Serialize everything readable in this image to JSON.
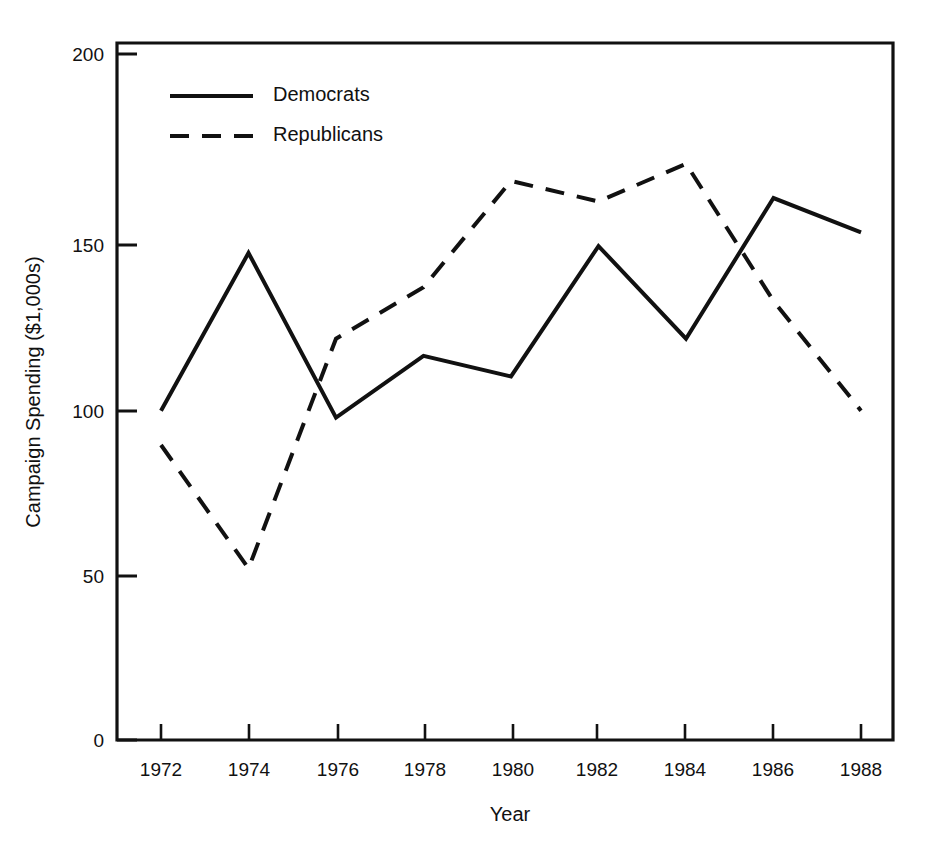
{
  "chart_data": {
    "type": "line",
    "title": "",
    "xlabel": "Year",
    "ylabel": "Campaign Spending ($1,000s)",
    "x": [
      1972,
      1974,
      1976,
      1978,
      1980,
      1982,
      1984,
      1986,
      1988
    ],
    "xtick_labels": [
      "1972",
      "1974",
      "1976",
      "1978",
      "1980",
      "1982",
      "1984",
      "1986",
      "1988"
    ],
    "ytick_labels": [
      "0",
      "50",
      "100",
      "150",
      "200"
    ],
    "yticks": [
      0,
      50,
      100,
      150,
      200
    ],
    "xlim": [
      1971,
      1989
    ],
    "ylim": [
      0,
      208
    ],
    "grid": false,
    "legend_position": "top-left-inside",
    "series": [
      {
        "name": "Democrats",
        "style": "solid",
        "color": "#111111",
        "values": [
          96,
          142,
          94,
          112,
          106,
          144,
          117,
          158,
          148
        ]
      },
      {
        "name": "Republicans",
        "style": "dashed",
        "color": "#111111",
        "values": [
          86,
          50,
          117,
          132,
          163,
          157,
          168,
          128,
          96
        ]
      }
    ]
  },
  "legend": {
    "entries": [
      {
        "label": "Democrats"
      },
      {
        "label": "Republicans"
      }
    ]
  },
  "axes": {
    "y_title": "Campaign Spending ($1,000s)",
    "x_title": "Year",
    "y_labels": [
      "200",
      "150",
      "100",
      "50",
      "0"
    ],
    "x_labels": [
      "1972",
      "1974",
      "1976",
      "1978",
      "1980",
      "1982",
      "1984",
      "1986",
      "1988"
    ]
  },
  "colors": {
    "ink": "#111111",
    "background": "#ffffff"
  }
}
